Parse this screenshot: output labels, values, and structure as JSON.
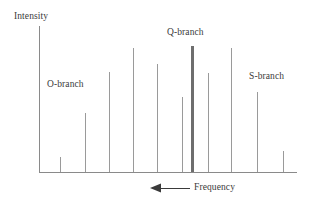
{
  "figure": {
    "background_color": "#ffffff"
  },
  "axes": {
    "y_axis_label": "Intensity",
    "x_axis_label": "Frequency",
    "x_axis_direction_icon": "left-arrow-icon",
    "axis_color": "#8a8a8a",
    "y_axis": {
      "x": 39,
      "y_top": 26,
      "y_bottom": 172
    },
    "x_axis": {
      "y": 172,
      "x_left": 39,
      "x_right": 297
    }
  },
  "annotations": {
    "o_branch_label": "O-branch",
    "q_branch_label": "Q-branch",
    "s_branch_label": "S-branch",
    "label_color": "#3a3a3a"
  },
  "chart_data": {
    "type": "bar",
    "title": "",
    "xlabel": "Frequency",
    "ylabel": "Intensity",
    "xlim": [
      39,
      297
    ],
    "ylim": [
      0,
      146
    ],
    "grid": false,
    "legend": "none",
    "x_axis_increases_leftward": true,
    "baseline_y": 172,
    "line_color": "#9a9a9a",
    "q_branch_color": "#6e6e6e",
    "categories": [
      "O-branch line 1",
      "O-branch line 2",
      "O-branch line 3",
      "O-branch line 4",
      "O-branch line 5",
      "O-branch line 6",
      "O-branch line 7",
      "Q-branch",
      "S-branch line 1",
      "S-branch line 2",
      "S-branch line 3",
      "S-branch line 4"
    ],
    "x": [
      60,
      85,
      109,
      133,
      157,
      182,
      194,
      208,
      231,
      257,
      283,
      0
    ],
    "values": [
      15,
      59,
      100,
      124,
      108,
      75,
      126,
      99,
      124,
      80,
      21,
      0
    ],
    "bars": [
      {
        "label": "O-branch line 1",
        "x": 60,
        "top_y": 157,
        "height": 15,
        "width": 1,
        "branch": "O",
        "color": "#9a9a9a"
      },
      {
        "label": "O-branch line 2",
        "x": 85,
        "top_y": 113,
        "height": 59,
        "width": 1,
        "branch": "O",
        "color": "#9a9a9a"
      },
      {
        "label": "O-branch line 3",
        "x": 109,
        "top_y": 72,
        "height": 100,
        "width": 1,
        "branch": "O",
        "color": "#9a9a9a"
      },
      {
        "label": "O-branch line 4",
        "x": 133,
        "top_y": 48,
        "height": 124,
        "width": 1,
        "branch": "O",
        "color": "#9a9a9a"
      },
      {
        "label": "O-branch line 5",
        "x": 157,
        "top_y": 64,
        "height": 108,
        "width": 1,
        "branch": "O",
        "color": "#9a9a9a"
      },
      {
        "label": "O-branch line 6",
        "x": 182,
        "top_y": 97,
        "height": 75,
        "width": 1,
        "branch": "O",
        "color": "#9a9a9a"
      },
      {
        "label": "Q-branch",
        "x": 192,
        "top_y": 46,
        "height": 126,
        "width": 3,
        "branch": "Q",
        "color": "#6e6e6e"
      },
      {
        "label": "S-branch line 1",
        "x": 208,
        "top_y": 73,
        "height": 99,
        "width": 1,
        "branch": "S",
        "color": "#9a9a9a"
      },
      {
        "label": "S-branch line 2",
        "x": 231,
        "top_y": 48,
        "height": 124,
        "width": 1,
        "branch": "S",
        "color": "#9a9a9a"
      },
      {
        "label": "S-branch line 3",
        "x": 257,
        "top_y": 92,
        "height": 80,
        "width": 1,
        "branch": "S",
        "color": "#9a9a9a"
      },
      {
        "label": "S-branch line 4",
        "x": 283,
        "top_y": 151,
        "height": 21,
        "width": 1,
        "branch": "S",
        "color": "#9a9a9a"
      }
    ],
    "annotations": [
      {
        "text": "O-branch",
        "x": 47,
        "y": 79
      },
      {
        "text": "Q-branch",
        "x": 167,
        "y": 27
      },
      {
        "text": "S-branch",
        "x": 249,
        "y": 71
      }
    ]
  },
  "frequency_arrow": {
    "tip_x": 150,
    "tail_x": 190,
    "y": 188,
    "color": "#3a3a3a",
    "direction": "left"
  }
}
